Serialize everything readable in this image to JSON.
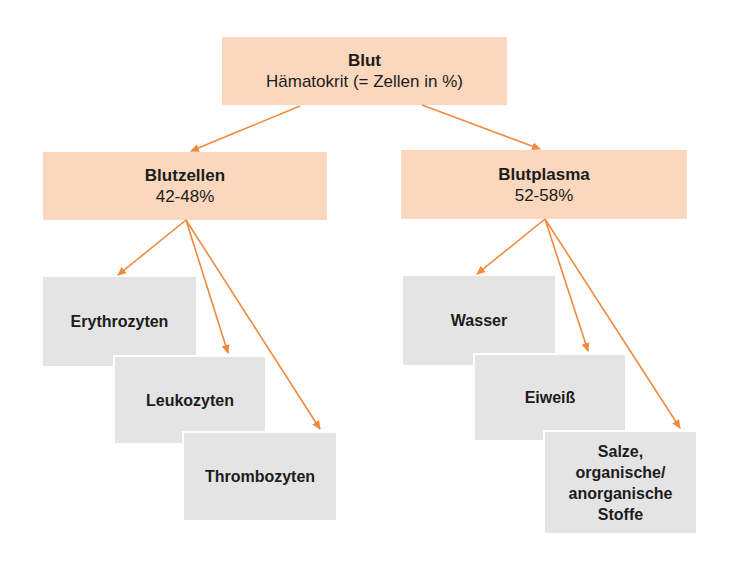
{
  "diagram": {
    "type": "tree",
    "colors": {
      "category_fill": "#fbd8bd",
      "leaf_fill": "#e4e4e4",
      "arrow": "#f08a3c",
      "text": "#1c1c1c"
    },
    "root": {
      "title": "Blut",
      "subtitle": "Hämatokrit (= Zellen in %)"
    },
    "branches": [
      {
        "title": "Blutzellen",
        "value": "42-48%",
        "children": [
          {
            "label": "Erythrozyten"
          },
          {
            "label": "Leukozyten"
          },
          {
            "label": "Thrombozyten"
          }
        ]
      },
      {
        "title": "Blutplasma",
        "value": "52-58%",
        "children": [
          {
            "label": "Wasser"
          },
          {
            "label": "Eiweiß"
          },
          {
            "label": "Salze, organische/ anorganische Stoffe",
            "lines": [
              "Salze,",
              "organische/",
              "anorganische",
              "Stoffe"
            ]
          }
        ]
      }
    ]
  }
}
